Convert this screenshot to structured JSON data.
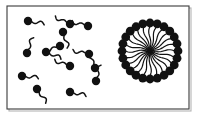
{
  "figure": {
    "canvas": {
      "width": 200,
      "height": 116,
      "background": "#ffffff"
    },
    "frame": {
      "name": "diagram-border",
      "x": 7,
      "y": 6,
      "width": 182,
      "height": 103,
      "stroke_color": "#3a3a3a",
      "stroke_width": 1.1,
      "shadow_color": "#b4b4b4",
      "shadow_offset": 2
    },
    "ink_color": "#111111"
  },
  "panels": [
    {
      "name": "monomer-panel",
      "label": "dispersed surfactant monomers",
      "region": {
        "x": 7,
        "y": 6,
        "width": 103,
        "height": 103
      }
    },
    {
      "name": "micelle-panel",
      "label": "assembled micelle",
      "region": {
        "x": 110,
        "y": 6,
        "width": 79,
        "height": 103
      }
    }
  ],
  "monomers": {
    "name": "surfactant-monomer-group",
    "count": 14,
    "head_radius": 4.2,
    "tail_length": 13,
    "tail_width": 1.5,
    "tail_wave_amplitude": 2.4,
    "items": [
      {
        "name": "monomer-1",
        "head_x": 28,
        "head_y": 21,
        "angle": 10
      },
      {
        "name": "monomer-2",
        "head_x": 70,
        "head_y": 24,
        "angle": 205
      },
      {
        "name": "monomer-3",
        "head_x": 88,
        "head_y": 26,
        "angle": 195
      },
      {
        "name": "monomer-4",
        "head_x": 63,
        "head_y": 32,
        "angle": 72
      },
      {
        "name": "monomer-5",
        "head_x": 27,
        "head_y": 53,
        "angle": 290
      },
      {
        "name": "monomer-6",
        "head_x": 46,
        "head_y": 52,
        "angle": 22
      },
      {
        "name": "monomer-7",
        "head_x": 89,
        "head_y": 54,
        "angle": 192
      },
      {
        "name": "monomer-8",
        "head_x": 70,
        "head_y": 66,
        "angle": 200
      },
      {
        "name": "monomer-9",
        "head_x": 22,
        "head_y": 76,
        "angle": 6
      },
      {
        "name": "monomer-10",
        "head_x": 96,
        "head_y": 81,
        "angle": 284
      },
      {
        "name": "monomer-11",
        "head_x": 37,
        "head_y": 89,
        "angle": 55
      },
      {
        "name": "monomer-12",
        "head_x": 70,
        "head_y": 92,
        "angle": 12
      },
      {
        "name": "monomer-13",
        "head_x": 60,
        "head_y": 46,
        "angle": 160
      },
      {
        "name": "monomer-14",
        "head_x": 95,
        "head_y": 68,
        "angle": 250
      }
    ]
  },
  "micelle": {
    "name": "micelle-assembly",
    "center_x": 150,
    "center_y": 51,
    "head_count": 24,
    "head_ring_radius": 28,
    "head_radius": 4.4,
    "tail_inner_radius": 2,
    "tail_width": 1.2,
    "tail_wave_amplitude": 1.6,
    "description": "Radially arranged surfactant molecules with hydrophilic heads outward and hydrophobic tails converging at the core"
  }
}
